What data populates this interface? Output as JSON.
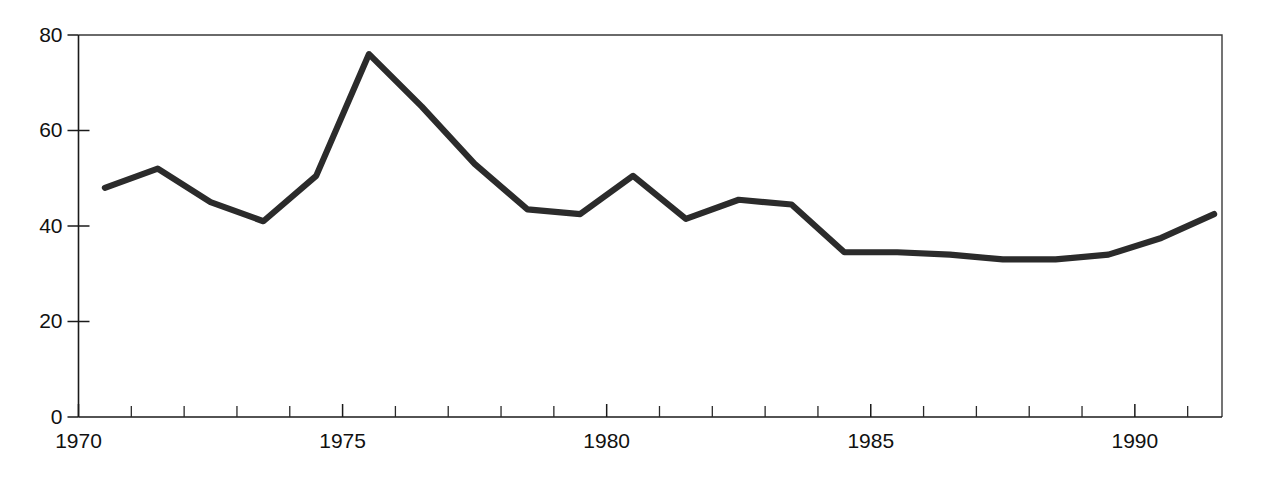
{
  "chart_data": {
    "type": "line",
    "title": "",
    "subtitle": "",
    "xlabel": "",
    "ylabel": "",
    "xlim": [
      1970,
      1991.65
    ],
    "ylim": [
      0,
      80
    ],
    "grid": false,
    "legend": null,
    "legend_position": "none",
    "line_color": "#2b2b2b",
    "axis_color": "#1a1a1a",
    "background_color": "#ffffff",
    "y_ticks": [
      0,
      20,
      40,
      60,
      80
    ],
    "y_tick_labels": [
      "0",
      "20",
      "40",
      "60",
      "80"
    ],
    "x_ticks": [
      1970,
      1971,
      1972,
      1973,
      1974,
      1975,
      1976,
      1977,
      1978,
      1979,
      1980,
      1981,
      1982,
      1983,
      1984,
      1985,
      1986,
      1987,
      1988,
      1989,
      1990,
      1991
    ],
    "x_tick_labels_shown": [
      "1970",
      "1975",
      "1980",
      "1985",
      "1990"
    ],
    "x_labeled_ticks": [
      1970,
      1975,
      1980,
      1985,
      1990
    ],
    "x": [
      1970.5,
      1971.5,
      1972.5,
      1973.5,
      1974.5,
      1975.5,
      1976.5,
      1977.5,
      1978.5,
      1979.5,
      1980.5,
      1981.5,
      1982.5,
      1983.5,
      1984.5,
      1985.5,
      1986.5,
      1987.5,
      1988.5,
      1989.5,
      1990.5,
      1991.5
    ],
    "values": [
      48,
      52,
      45,
      41,
      50.5,
      76,
      65,
      53,
      43.5,
      42.5,
      50.5,
      41.5,
      45.5,
      44.5,
      34.5,
      34.5,
      34,
      33,
      33,
      34,
      37.5,
      42.5
    ],
    "series": [
      {
        "name": "series-1",
        "values": [
          48,
          52,
          45,
          41,
          50.5,
          76,
          65,
          53,
          43.5,
          42.5,
          50.5,
          41.5,
          45.5,
          44.5,
          34.5,
          34.5,
          34,
          33,
          33,
          34,
          37.5,
          42.5
        ]
      }
    ],
    "annotations": []
  }
}
